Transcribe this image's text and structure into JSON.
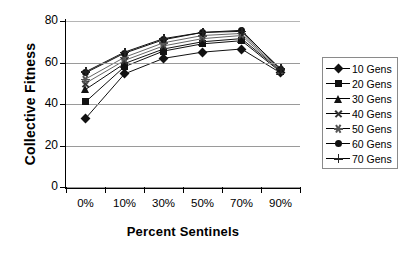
{
  "chart_data": {
    "type": "line",
    "title": "",
    "xlabel": "Percent Sentinels",
    "ylabel": "Collective Fitness",
    "categories": [
      "0%",
      "10%",
      "30%",
      "50%",
      "70%",
      "90%"
    ],
    "ylim": [
      0,
      80
    ],
    "yticks": [
      0,
      20,
      40,
      60,
      80
    ],
    "grid": true,
    "legend_position": "right",
    "series": [
      {
        "name": "10 Gens",
        "marker": "diamond",
        "values": [
          33,
          54.5,
          62,
          65,
          66.5,
          55
        ]
      },
      {
        "name": "20 Gens",
        "marker": "square",
        "values": [
          41,
          58,
          65.5,
          69,
          70.5,
          55.5
        ]
      },
      {
        "name": "30 Gens",
        "marker": "triangle",
        "values": [
          47,
          59.5,
          66.5,
          70,
          71.5,
          56
        ]
      },
      {
        "name": "40 Gens",
        "marker": "x",
        "values": [
          50,
          61,
          68,
          71.5,
          73,
          56
        ]
      },
      {
        "name": "50 Gens",
        "marker": "star",
        "values": [
          52,
          62.5,
          69.5,
          73,
          74,
          56.5
        ]
      },
      {
        "name": "60 Gens",
        "marker": "circle",
        "values": [
          55,
          64.5,
          71,
          74.5,
          75.5,
          56.5
        ]
      },
      {
        "name": "70 Gens",
        "marker": "plus",
        "values": [
          55.5,
          65,
          71.5,
          74.5,
          75,
          57
        ]
      }
    ]
  }
}
